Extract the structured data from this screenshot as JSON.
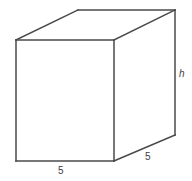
{
  "figure": {
    "name": "rectangular-prism",
    "background_color": "#ffffff",
    "stroke_color": "#4a4a4a",
    "label_color": "#3d3d3d",
    "labels": {
      "width": "5",
      "depth": "5",
      "height": "h"
    },
    "geometry": {
      "front_top_left": [
        16,
        40
      ],
      "front_top_right": [
        114,
        40
      ],
      "front_bottom_right": [
        114,
        161
      ],
      "front_bottom_left": [
        16,
        161
      ],
      "back_top_left": [
        78,
        10
      ],
      "back_top_right": [
        175,
        10
      ],
      "back_bottom_right": [
        175,
        135
      ]
    }
  }
}
